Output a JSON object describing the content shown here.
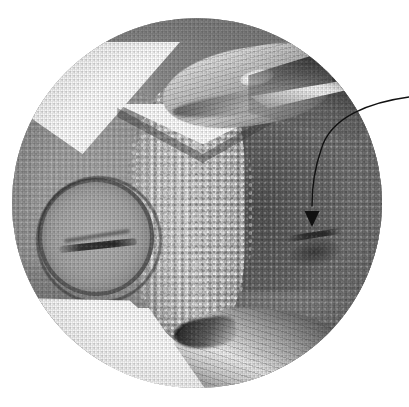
{
  "figure": {
    "kind": "photomicrograph",
    "field_shape": "circle",
    "background_color": "#ffffff",
    "caption": "",
    "circle": {
      "cx": 197,
      "cy": 203,
      "r": 185
    }
  },
  "palette": {
    "paper_white": "#ffffff",
    "highlight": "#f4f4f4",
    "granular_light": "#d2d2d2",
    "midtone_light": "#b3b3b3",
    "midtone": "#9c9c9c",
    "midtone_dark": "#838383",
    "shadow": "#5a5a5a",
    "deep_shadow": "#2a2a2a",
    "ink_black": "#111111"
  },
  "annotation": {
    "type": "leader-arrow",
    "label": "",
    "stroke_color": "#111111",
    "stroke_width": 1.4,
    "start_point": {
      "x": 409,
      "y": 97
    },
    "control_point": {
      "x": 330,
      "y": 120
    },
    "end_point": {
      "x": 312,
      "y": 206
    },
    "arrowhead": {
      "x": 312,
      "y": 219,
      "direction": "down",
      "width": 15,
      "height": 16
    },
    "points_at": "dark-oval-feature-right-lobe"
  },
  "structures": [
    {
      "name": "left-disc",
      "label": "left oval disc with dark rim",
      "tone": "#a9a9a9"
    },
    {
      "name": "left-disc-slit",
      "label": "horizontal dark slit",
      "tone": "#232323"
    },
    {
      "name": "granular-band",
      "label": "central papillate granular band",
      "tone": "#d2d2d2"
    },
    {
      "name": "right-lobe",
      "label": "right lobe",
      "tone": "#838383"
    },
    {
      "name": "target-feature",
      "label": "dark oval feature indicated by arrow",
      "tone": "#2d2d2d"
    },
    {
      "name": "cleft",
      "label": "V-shaped cleft / notch",
      "tone": "#ffffff"
    },
    {
      "name": "wing-top",
      "label": "upper wing-like appendage",
      "tone": "#c9c9c9"
    },
    {
      "name": "wing-bottom",
      "label": "lower wing-like appendage",
      "tone": "#c2c2c2"
    },
    {
      "name": "dark-sweep",
      "label": "dark sweep at upper right rim",
      "tone": "#1e1e1e"
    }
  ]
}
